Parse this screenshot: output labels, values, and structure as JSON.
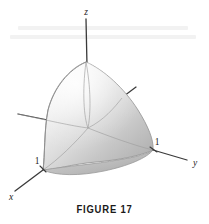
{
  "figure": {
    "caption": "FIGURE 17",
    "axes": {
      "z_label": "z",
      "y_label": "y",
      "x_label": "x"
    },
    "ticks": {
      "x_tick": "1",
      "y_tick": "1"
    },
    "colors": {
      "background": "#ffffff",
      "axis_line": "#3a3a3a",
      "surface_light": "#f4f4f4",
      "surface_mid": "#d8d8d8",
      "surface_dark": "#b4b4b4",
      "surface_outline": "#9a9a9a",
      "text": "#1a1a1a"
    },
    "geometry": {
      "origin": {
        "x": 88,
        "y": 128
      },
      "z_axis_tip": {
        "x": 86,
        "y": 19
      },
      "y_axis_tip": {
        "x": 188,
        "y": 160
      },
      "x_axis_tip": {
        "x": 14,
        "y": 192
      },
      "x_unit_point": {
        "x": 43,
        "y": 170
      },
      "y_unit_point": {
        "x": 153,
        "y": 150
      },
      "z_unit_point": {
        "x": 86,
        "y": 62
      },
      "neg_y_stub_start": {
        "x": 18,
        "y": 114
      },
      "neg_x_stub_end": {
        "x": 135,
        "y": 88
      }
    }
  }
}
